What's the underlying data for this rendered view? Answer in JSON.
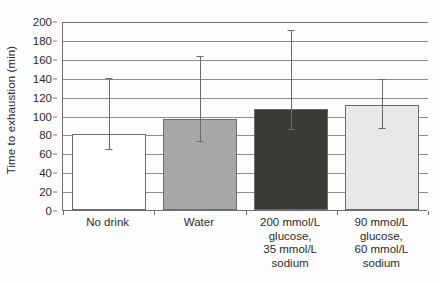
{
  "chart_data": {
    "type": "bar",
    "title": "",
    "xlabel": "",
    "ylabel": "Time to exhaustion (min)",
    "ylim": [
      0,
      200
    ],
    "yticks": [
      0,
      20,
      40,
      60,
      80,
      100,
      120,
      140,
      160,
      180,
      200
    ],
    "ytick_labels": [
      "0",
      "20",
      "40",
      "60",
      "80",
      "100",
      "120",
      "140",
      "160",
      "180",
      "200"
    ],
    "grid": true,
    "legend": "none",
    "categories": [
      "No drink",
      "Water",
      "200 mmol/L glucose, 35 mmol/L sodium",
      "90 mmol/L glucose, 60 mmol/L sodium"
    ],
    "category_lines": [
      [
        "No drink"
      ],
      [
        "Water"
      ],
      [
        "200 mmol/L",
        "glucose,",
        "35 mmol/L",
        "sodium"
      ],
      [
        "90 mmol/L",
        "glucose,",
        "60 mmol/L",
        "sodium"
      ]
    ],
    "values": [
      80,
      96,
      107,
      111
    ],
    "errors_upper": [
      141,
      164,
      192,
      140
    ],
    "errors_lower": [
      66,
      74,
      87,
      88
    ],
    "bar_colors": [
      "#ffffff",
      "#a8a8a8",
      "#3a3a36",
      "#e8e8e8"
    ],
    "bar_edge_color": "#6b6b6b",
    "errorbar_color": "#6a6a6a",
    "gridline_color": "#8d8d8d",
    "axis_color": "#6f6f6f",
    "text_color": "#2b2b2b"
  }
}
